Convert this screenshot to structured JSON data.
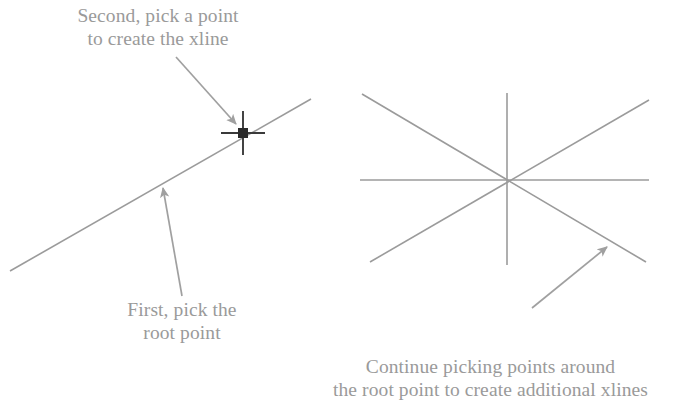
{
  "figure": {
    "background_color": "#ffffff",
    "line_color": "#9b9b9b",
    "arrow_color": "#a0a0a0",
    "text_color": "#9a9a9a",
    "cursor_color": "#3a3a3a"
  },
  "captions": {
    "second_pick": "Second, pick a point\nto create the xline",
    "first_pick": "First, pick the\nroot point",
    "continue_picking": "Continue picking points around\nthe root point to create additional xlines"
  },
  "left_diagram": {
    "name": "single-xline-with-crosshair",
    "xline": {
      "x1": 10,
      "y1": 271,
      "x2": 311,
      "y2": 99
    },
    "crosshair": {
      "center_x": 243,
      "center_y": 133,
      "arm_length": 22,
      "pickbox_size": 9
    },
    "annotation_arrows": [
      {
        "name": "arrow-to-pick-point",
        "x1": 176,
        "y1": 57,
        "x2": 236,
        "y2": 124
      },
      {
        "name": "arrow-to-root-point",
        "x1": 182,
        "y1": 296,
        "x2": 162,
        "y2": 186
      }
    ]
  },
  "right_diagram": {
    "name": "multiple-xlines-starburst",
    "root_point": {
      "x": 507,
      "y": 180
    },
    "xlines": [
      {
        "name": "xline-vertical",
        "x1": 507,
        "y1": 93,
        "x2": 507,
        "y2": 265
      },
      {
        "name": "xline-horizontal",
        "x1": 360,
        "y1": 180,
        "x2": 649,
        "y2": 180
      },
      {
        "name": "xline-diagonal-up",
        "x1": 370,
        "y1": 262,
        "x2": 649,
        "y2": 100
      },
      {
        "name": "xline-diagonal-down",
        "x1": 362,
        "y1": 94,
        "x2": 646,
        "y2": 262
      }
    ],
    "annotation_arrows": [
      {
        "name": "arrow-to-additional-xline",
        "x1": 532,
        "y1": 308,
        "x2": 607,
        "y2": 247
      }
    ]
  }
}
